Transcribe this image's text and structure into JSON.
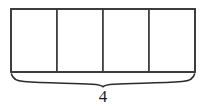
{
  "figure": {
    "background_color": "#ffffff",
    "stroke_color": "#3a3a3a",
    "brace_color": "#2b2b2b",
    "label_color": "#1a1a1a",
    "shape": {
      "type": "partitioned-rectangle",
      "x": 11,
      "y": 9,
      "width": 184,
      "height": 63,
      "fill": "#ffffff",
      "stroke_width": 1.6,
      "cell_count": 4,
      "cells": [
        {
          "index": 1,
          "label": "",
          "x": 11,
          "width": 46
        },
        {
          "index": 2,
          "label": "",
          "x": 57,
          "width": 46
        },
        {
          "index": 3,
          "label": "",
          "x": 103,
          "width": 46
        },
        {
          "index": 4,
          "label": "",
          "x": 149,
          "width": 46
        }
      ],
      "divider_x_positions": [
        57,
        103,
        149
      ]
    },
    "brace": {
      "orientation": "bottom",
      "left_x": 11,
      "right_x": 195,
      "top_y": 74,
      "tip_y": 86,
      "center_x": 103,
      "stroke_width": 1.5,
      "label": "4",
      "label_x": 103,
      "label_y": 102
    }
  }
}
